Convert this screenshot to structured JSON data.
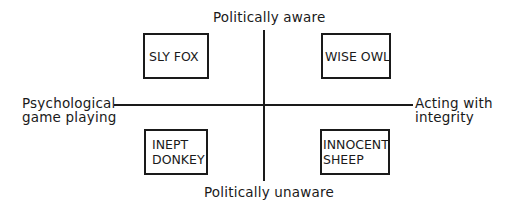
{
  "diagram": {
    "axes": {
      "top": "Politically aware",
      "bottom": "Politically unaware",
      "left": [
        "Psychological",
        "game playing"
      ],
      "right": [
        "Acting with",
        "integrity"
      ]
    },
    "quadrants": {
      "top_left": [
        "SLY FOX"
      ],
      "top_right": [
        "WISE OWL"
      ],
      "bottom_left": [
        "INEPT",
        "DONKEY"
      ],
      "bottom_right": [
        "INNOCENT",
        "SHEEP"
      ]
    },
    "colors": {
      "line": "#1a1a1a",
      "background": "#ffffff"
    }
  }
}
